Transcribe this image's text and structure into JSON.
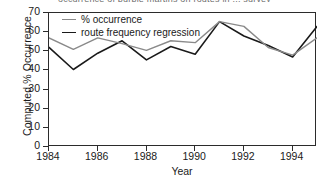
{
  "figure": {
    "clipped_caption": "occurrence of purple martins on routes in ... survey",
    "background": "#ffffff"
  },
  "chart_data": {
    "type": "line",
    "title": "",
    "xlabel": "Year",
    "ylabel": "Computed % Occurrence",
    "x": [
      1984,
      1985,
      1986,
      1987,
      1988,
      1989,
      1990,
      1991,
      1992,
      1993,
      1994,
      1995
    ],
    "xlim": [
      1984,
      1995
    ],
    "ylim": [
      0,
      70
    ],
    "xticks": [
      1984,
      1986,
      1988,
      1990,
      1992,
      1994
    ],
    "xticklabels": [
      "1984",
      "1986",
      "1988",
      "1990",
      "1992",
      "1994"
    ],
    "yticks": [
      0,
      10,
      20,
      30,
      40,
      50,
      60,
      70
    ],
    "yticklabels": [
      "0",
      "10",
      "20",
      "30",
      "40",
      "50",
      "60",
      "70"
    ],
    "grid": false,
    "legend_position": "upper-left-inside",
    "series": [
      {
        "name": "% occurrence",
        "color": "#8a8a8a",
        "values": [
          57,
          51,
          57,
          54,
          50.5,
          55.5,
          54.5,
          65.5,
          63,
          52,
          48,
          57
        ]
      },
      {
        "name": "route frequency regression",
        "color": "#1a1a1a",
        "values": [
          52,
          40.5,
          49,
          55.5,
          45.5,
          52.5,
          48.5,
          65.5,
          58,
          53,
          47,
          63
        ]
      }
    ]
  }
}
